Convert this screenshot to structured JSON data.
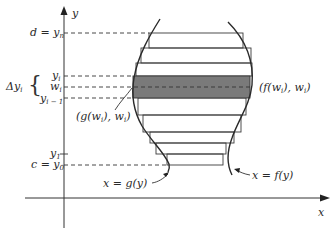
{
  "diagram": {
    "axes": {
      "x_label": "x",
      "y_label": "y"
    },
    "left_labels": {
      "d_yn": "d = y",
      "d_yn_sub": "n",
      "yi": "y",
      "yi_sub": "i",
      "wi": "w",
      "wi_sub": "i",
      "yi_minus_1": "y",
      "yi_minus_1_sub": "i − 1",
      "delta_yi": "Δy",
      "delta_yi_sub": "i",
      "y1": "y",
      "y1_sub": "1",
      "c_y0": "c = y",
      "c_y0_sub": "0"
    },
    "point_labels": {
      "g_point": "(g(w",
      "g_point_sub": "i",
      "g_point_tail": "), w",
      "g_point_sub2": "i",
      "g_point_end": ")",
      "f_point": "(f(w",
      "f_point_sub": "i",
      "f_point_tail": "), w",
      "f_point_sub2": "i",
      "f_point_end": ")"
    },
    "curve_labels": {
      "left_curve": "x = g(y)",
      "right_curve": "x = f(y)"
    },
    "colors": {
      "line": "#333333",
      "shaded_strip": "#7a7a7a",
      "background": "#ffffff"
    }
  }
}
